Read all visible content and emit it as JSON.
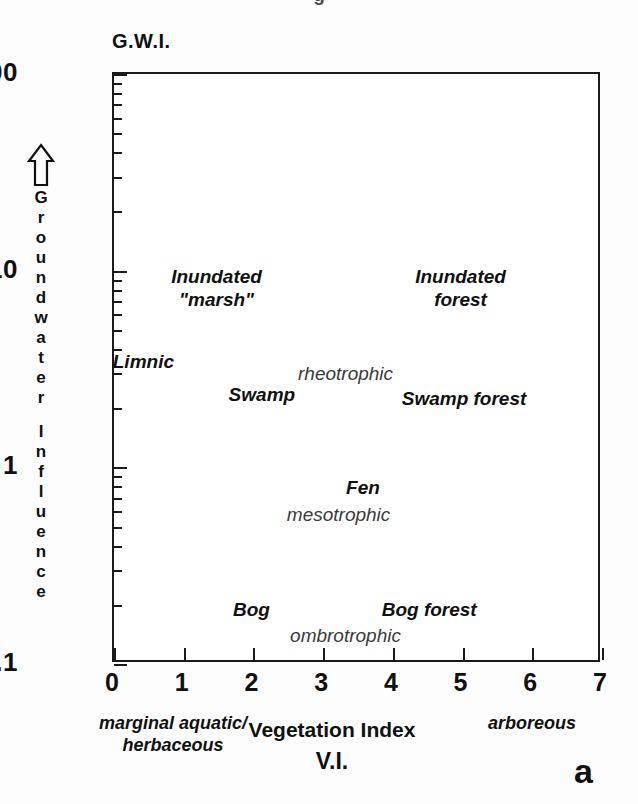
{
  "figure": {
    "panel_letter": "a",
    "top_cut_text": "g",
    "gwi_axis_heading": "G.W.I.",
    "y_axis_title": "Groundwater Influence",
    "y_axis_arrow_icon": "up-arrow-outline-icon",
    "x_axis_title": "Vegetation Index",
    "x_axis_abbrev": "V.I.",
    "x_note_left": "marginal aquatic/\nherbaceous",
    "x_note_right": "arboreous",
    "ink_color": "#111111",
    "background_color": "#ffffff"
  },
  "chart_data": {
    "type": "scatter",
    "title": "",
    "xlabel": "Vegetation Index",
    "ylabel": "Groundwater Influence",
    "x_abbrev": "V.I.",
    "y_abbrev": "G.W.I.",
    "xlim": [
      0,
      7
    ],
    "ylim": [
      0.1,
      100
    ],
    "yscale": "log",
    "xscale": "linear",
    "grid": false,
    "legend": "none",
    "x_ticks": [
      0,
      1,
      2,
      3,
      4,
      5,
      6,
      7
    ],
    "x_tick_labels": [
      "0",
      "1",
      "2",
      "3",
      "4",
      "5",
      "6",
      "7"
    ],
    "y_ticks": [
      0.1,
      1,
      10,
      100
    ],
    "y_tick_labels": [
      "0.1",
      "1",
      "10",
      "100"
    ],
    "y_minor_ticks": [
      0.2,
      0.3,
      0.4,
      0.5,
      0.6,
      0.7,
      0.8,
      0.9,
      2,
      3,
      4,
      5,
      6,
      7,
      8,
      9,
      20,
      30,
      40,
      50,
      60,
      70,
      80,
      90
    ],
    "annotations": [
      {
        "text": "Inundated\n\"marsh\"",
        "x": 1.5,
        "y": 8.0,
        "style": "type"
      },
      {
        "text": "Inundated\nforest",
        "x": 5.0,
        "y": 8.0,
        "style": "type"
      },
      {
        "text": "Limnic",
        "x": 0.45,
        "y": 3.4,
        "style": "type"
      },
      {
        "text": "Swamp",
        "x": 2.15,
        "y": 2.3,
        "style": "type"
      },
      {
        "text": "Swamp forest",
        "x": 5.05,
        "y": 2.2,
        "style": "type"
      },
      {
        "text": "Fen",
        "x": 3.6,
        "y": 0.78,
        "style": "type"
      },
      {
        "text": "Bog",
        "x": 2.0,
        "y": 0.185,
        "style": "type"
      },
      {
        "text": "Bog forest",
        "x": 4.55,
        "y": 0.185,
        "style": "type"
      },
      {
        "text": "rheotrophic",
        "x": 3.35,
        "y": 2.9,
        "style": "trophic"
      },
      {
        "text": "mesotrophic",
        "x": 3.25,
        "y": 0.56,
        "style": "trophic"
      },
      {
        "text": "ombrotrophic",
        "x": 3.35,
        "y": 0.135,
        "style": "trophic"
      }
    ]
  }
}
